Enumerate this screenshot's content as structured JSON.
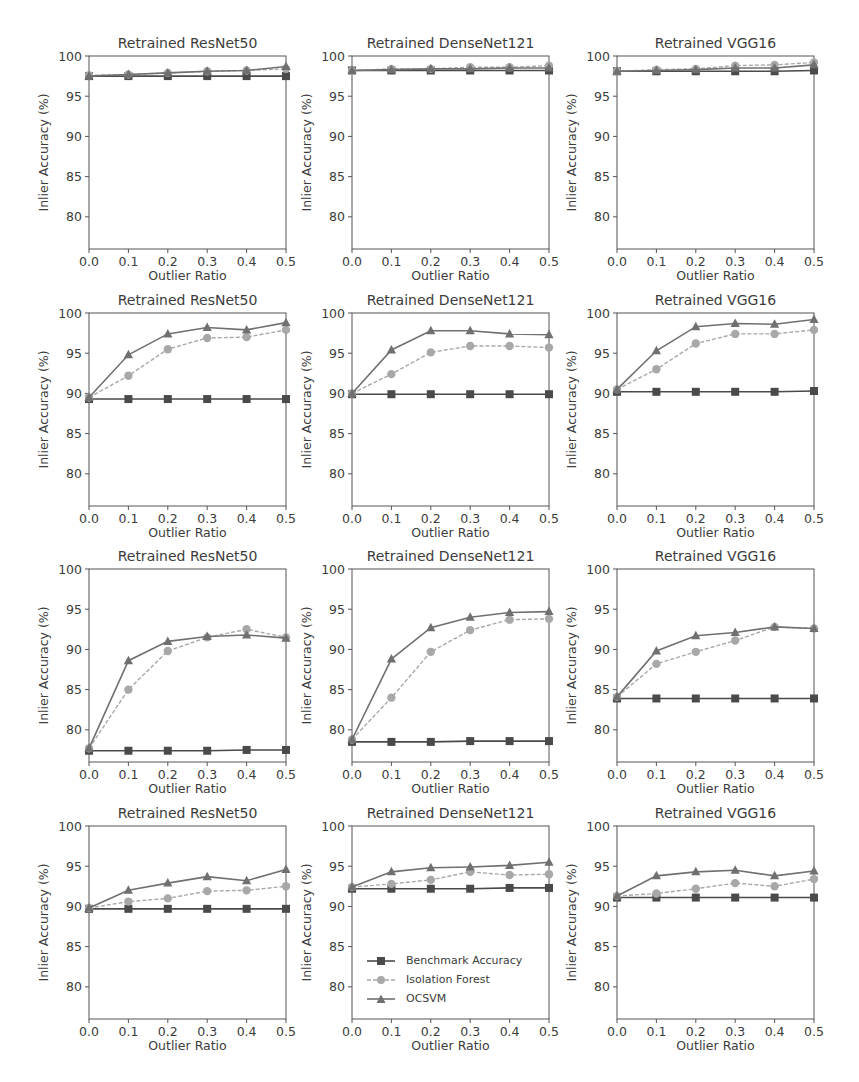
{
  "figure": {
    "legend": [
      {
        "label": "Benchmark Accuracy",
        "marker": "square",
        "color": "#4a4a4a",
        "line": "solid"
      },
      {
        "label": "Isolation Forest",
        "marker": "circle",
        "color": "#a8a8a8",
        "line": "dashed"
      },
      {
        "label": "OCSVM",
        "marker": "triangle",
        "color": "#707070",
        "line": "solid"
      }
    ]
  },
  "chart_data": [
    {
      "type": "line",
      "row": 0,
      "col": 0,
      "title": "Retrained ResNet50",
      "xlabel": "Outlier Ratio",
      "ylabel": "Inlier Accuracy (%)",
      "x": [
        0.0,
        0.1,
        0.2,
        0.3,
        0.4,
        0.5
      ],
      "xticks": [
        "0.0",
        "0.1",
        "0.2",
        "0.3",
        "0.4",
        "0.5"
      ],
      "yticks": [
        80,
        85,
        90,
        95,
        100
      ],
      "xlim": [
        0.0,
        0.5
      ],
      "ylim": [
        76,
        100
      ],
      "series": [
        {
          "name": "Benchmark Accuracy",
          "values": [
            97.5,
            97.5,
            97.5,
            97.5,
            97.5,
            97.5
          ]
        },
        {
          "name": "Isolation Forest",
          "values": [
            97.6,
            97.7,
            97.9,
            98.1,
            98.2,
            98.4
          ]
        },
        {
          "name": "OCSVM",
          "values": [
            97.5,
            97.7,
            97.9,
            98.1,
            98.2,
            98.7
          ]
        }
      ]
    },
    {
      "type": "line",
      "row": 0,
      "col": 1,
      "title": "Retrained DenseNet121",
      "xlabel": "Outlier Ratio",
      "ylabel": "Inlier Accuracy (%)",
      "x": [
        0.0,
        0.1,
        0.2,
        0.3,
        0.4,
        0.5
      ],
      "xticks": [
        "0.0",
        "0.1",
        "0.2",
        "0.3",
        "0.4",
        "0.5"
      ],
      "yticks": [
        80,
        85,
        90,
        95,
        100
      ],
      "xlim": [
        0.0,
        0.5
      ],
      "ylim": [
        76,
        100
      ],
      "series": [
        {
          "name": "Benchmark Accuracy",
          "values": [
            98.2,
            98.2,
            98.2,
            98.2,
            98.2,
            98.2
          ]
        },
        {
          "name": "Isolation Forest",
          "values": [
            98.2,
            98.4,
            98.4,
            98.6,
            98.6,
            98.8
          ]
        },
        {
          "name": "OCSVM",
          "values": [
            98.2,
            98.3,
            98.4,
            98.4,
            98.5,
            98.5
          ]
        }
      ]
    },
    {
      "type": "line",
      "row": 0,
      "col": 2,
      "title": "Retrained VGG16",
      "xlabel": "Outlier Ratio",
      "ylabel": "Inlier Accuracy (%)",
      "x": [
        0.0,
        0.1,
        0.2,
        0.3,
        0.4,
        0.5
      ],
      "xticks": [
        "0.0",
        "0.1",
        "0.2",
        "0.3",
        "0.4",
        "0.5"
      ],
      "yticks": [
        80,
        85,
        90,
        95,
        100
      ],
      "xlim": [
        0.0,
        0.5
      ],
      "ylim": [
        76,
        100
      ],
      "series": [
        {
          "name": "Benchmark Accuracy",
          "values": [
            98.1,
            98.1,
            98.1,
            98.1,
            98.1,
            98.2
          ]
        },
        {
          "name": "Isolation Forest",
          "values": [
            98.1,
            98.3,
            98.4,
            98.8,
            98.9,
            99.2
          ]
        },
        {
          "name": "OCSVM",
          "values": [
            98.1,
            98.2,
            98.3,
            98.5,
            98.5,
            98.9
          ]
        }
      ]
    },
    {
      "type": "line",
      "row": 1,
      "col": 0,
      "title": "Retrained ResNet50",
      "xlabel": "Outlier Ratio",
      "ylabel": "Inlier Accuracy (%)",
      "x": [
        0.0,
        0.1,
        0.2,
        0.3,
        0.4,
        0.5
      ],
      "xticks": [
        "0.0",
        "0.1",
        "0.2",
        "0.3",
        "0.4",
        "0.5"
      ],
      "yticks": [
        80,
        85,
        90,
        95,
        100
      ],
      "xlim": [
        0.0,
        0.5
      ],
      "ylim": [
        76,
        100
      ],
      "series": [
        {
          "name": "Benchmark Accuracy",
          "values": [
            89.3,
            89.3,
            89.3,
            89.3,
            89.3,
            89.3
          ]
        },
        {
          "name": "Isolation Forest",
          "values": [
            89.5,
            92.2,
            95.5,
            96.9,
            97.0,
            97.9
          ]
        },
        {
          "name": "OCSVM",
          "values": [
            89.5,
            94.8,
            97.4,
            98.2,
            97.9,
            98.8
          ]
        }
      ]
    },
    {
      "type": "line",
      "row": 1,
      "col": 1,
      "title": "Retrained DenseNet121",
      "xlabel": "Outlier Ratio",
      "ylabel": "Inlier Accuracy (%)",
      "x": [
        0.0,
        0.1,
        0.2,
        0.3,
        0.4,
        0.5
      ],
      "xticks": [
        "0.0",
        "0.1",
        "0.2",
        "0.3",
        "0.4",
        "0.5"
      ],
      "yticks": [
        80,
        85,
        90,
        95,
        100
      ],
      "xlim": [
        0.0,
        0.5
      ],
      "ylim": [
        76,
        100
      ],
      "series": [
        {
          "name": "Benchmark Accuracy",
          "values": [
            89.9,
            89.9,
            89.9,
            89.9,
            89.9,
            89.9
          ]
        },
        {
          "name": "Isolation Forest",
          "values": [
            90.0,
            92.4,
            95.1,
            95.9,
            95.9,
            95.7
          ]
        },
        {
          "name": "OCSVM",
          "values": [
            90.0,
            95.4,
            97.8,
            97.8,
            97.4,
            97.3
          ]
        }
      ]
    },
    {
      "type": "line",
      "row": 1,
      "col": 2,
      "title": "Retrained VGG16",
      "xlabel": "Outlier Ratio",
      "ylabel": "Inlier Accuracy (%)",
      "x": [
        0.0,
        0.1,
        0.2,
        0.3,
        0.4,
        0.5
      ],
      "xticks": [
        "0.0",
        "0.1",
        "0.2",
        "0.3",
        "0.4",
        "0.5"
      ],
      "yticks": [
        80,
        85,
        90,
        95,
        100
      ],
      "xlim": [
        0.0,
        0.5
      ],
      "ylim": [
        76,
        100
      ],
      "series": [
        {
          "name": "Benchmark Accuracy",
          "values": [
            90.2,
            90.2,
            90.2,
            90.2,
            90.2,
            90.3
          ]
        },
        {
          "name": "Isolation Forest",
          "values": [
            90.5,
            93.0,
            96.2,
            97.4,
            97.4,
            97.9
          ]
        },
        {
          "name": "OCSVM",
          "values": [
            90.5,
            95.3,
            98.3,
            98.7,
            98.6,
            99.2
          ]
        }
      ]
    },
    {
      "type": "line",
      "row": 2,
      "col": 0,
      "title": "Retrained ResNet50",
      "xlabel": "Outlier Ratio",
      "ylabel": "Inlier Accuracy (%)",
      "x": [
        0.0,
        0.1,
        0.2,
        0.3,
        0.4,
        0.5
      ],
      "xticks": [
        "0.0",
        "0.1",
        "0.2",
        "0.3",
        "0.4",
        "0.5"
      ],
      "yticks": [
        80,
        85,
        90,
        95,
        100
      ],
      "xlim": [
        0.0,
        0.5
      ],
      "ylim": [
        76,
        100
      ],
      "series": [
        {
          "name": "Benchmark Accuracy",
          "values": [
            77.4,
            77.4,
            77.4,
            77.4,
            77.5,
            77.5
          ]
        },
        {
          "name": "Isolation Forest",
          "values": [
            77.7,
            85.0,
            89.8,
            91.5,
            92.5,
            91.5
          ]
        },
        {
          "name": "OCSVM",
          "values": [
            77.7,
            88.6,
            91.0,
            91.6,
            91.8,
            91.4
          ]
        }
      ]
    },
    {
      "type": "line",
      "row": 2,
      "col": 1,
      "title": "Retrained DenseNet121",
      "xlabel": "Outlier Ratio",
      "ylabel": "Inlier Accuracy (%)",
      "x": [
        0.0,
        0.1,
        0.2,
        0.3,
        0.4,
        0.5
      ],
      "xticks": [
        "0.0",
        "0.1",
        "0.2",
        "0.3",
        "0.4",
        "0.5"
      ],
      "yticks": [
        80,
        85,
        90,
        95,
        100
      ],
      "xlim": [
        0.0,
        0.5
      ],
      "ylim": [
        76,
        100
      ],
      "series": [
        {
          "name": "Benchmark Accuracy",
          "values": [
            78.5,
            78.5,
            78.5,
            78.6,
            78.6,
            78.6
          ]
        },
        {
          "name": "Isolation Forest",
          "values": [
            78.8,
            84.0,
            89.7,
            92.4,
            93.7,
            93.8
          ]
        },
        {
          "name": "OCSVM",
          "values": [
            78.8,
            88.8,
            92.7,
            94.0,
            94.6,
            94.7
          ]
        }
      ]
    },
    {
      "type": "line",
      "row": 2,
      "col": 2,
      "title": "Retrained VGG16",
      "xlabel": "Outlier Ratio",
      "ylabel": "Inlier Accuracy (%)",
      "x": [
        0.0,
        0.1,
        0.2,
        0.3,
        0.4,
        0.5
      ],
      "xticks": [
        "0.0",
        "0.1",
        "0.2",
        "0.3",
        "0.4",
        "0.5"
      ],
      "yticks": [
        80,
        85,
        90,
        95,
        100
      ],
      "xlim": [
        0.0,
        0.5
      ],
      "ylim": [
        76,
        100
      ],
      "series": [
        {
          "name": "Benchmark Accuracy",
          "values": [
            83.9,
            83.9,
            83.9,
            83.9,
            83.9,
            83.9
          ]
        },
        {
          "name": "Isolation Forest",
          "values": [
            84.1,
            88.2,
            89.7,
            91.1,
            92.8,
            92.6
          ]
        },
        {
          "name": "OCSVM",
          "values": [
            84.1,
            89.8,
            91.7,
            92.1,
            92.8,
            92.6
          ]
        }
      ]
    },
    {
      "type": "line",
      "row": 3,
      "col": 0,
      "title": "Retrained ResNet50",
      "xlabel": "Outlier Ratio",
      "ylabel": "Inlier Accuracy (%)",
      "x": [
        0.0,
        0.1,
        0.2,
        0.3,
        0.4,
        0.5
      ],
      "xticks": [
        "0.0",
        "0.1",
        "0.2",
        "0.3",
        "0.4",
        "0.5"
      ],
      "yticks": [
        80,
        85,
        90,
        95,
        100
      ],
      "xlim": [
        0.0,
        0.5
      ],
      "ylim": [
        76,
        100
      ],
      "series": [
        {
          "name": "Benchmark Accuracy",
          "values": [
            89.7,
            89.7,
            89.7,
            89.7,
            89.7,
            89.7
          ]
        },
        {
          "name": "Isolation Forest",
          "values": [
            89.8,
            90.6,
            91.0,
            91.9,
            92.0,
            92.5
          ]
        },
        {
          "name": "OCSVM",
          "values": [
            89.8,
            92.0,
            92.9,
            93.7,
            93.2,
            94.6
          ]
        }
      ]
    },
    {
      "type": "line",
      "row": 3,
      "col": 1,
      "title": "Retrained DenseNet121",
      "xlabel": "Outlier Ratio",
      "ylabel": "Inlier Accuracy (%)",
      "x": [
        0.0,
        0.1,
        0.2,
        0.3,
        0.4,
        0.5
      ],
      "xticks": [
        "0.0",
        "0.1",
        "0.2",
        "0.3",
        "0.4",
        "0.5"
      ],
      "yticks": [
        80,
        85,
        90,
        95,
        100
      ],
      "xlim": [
        0.0,
        0.5
      ],
      "ylim": [
        76,
        100
      ],
      "series": [
        {
          "name": "Benchmark Accuracy",
          "values": [
            92.2,
            92.2,
            92.2,
            92.2,
            92.3,
            92.3
          ]
        },
        {
          "name": "Isolation Forest",
          "values": [
            92.4,
            92.8,
            93.3,
            94.3,
            93.9,
            94.0
          ]
        },
        {
          "name": "OCSVM",
          "values": [
            92.4,
            94.3,
            94.8,
            94.9,
            95.1,
            95.5
          ]
        }
      ]
    },
    {
      "type": "line",
      "row": 3,
      "col": 2,
      "title": "Retrained VGG16",
      "xlabel": "Outlier Ratio",
      "ylabel": "Inlier Accuracy (%)",
      "x": [
        0.0,
        0.1,
        0.2,
        0.3,
        0.4,
        0.5
      ],
      "xticks": [
        "0.0",
        "0.1",
        "0.2",
        "0.3",
        "0.4",
        "0.5"
      ],
      "yticks": [
        80,
        85,
        90,
        95,
        100
      ],
      "xlim": [
        0.0,
        0.5
      ],
      "ylim": [
        76,
        100
      ],
      "series": [
        {
          "name": "Benchmark Accuracy",
          "values": [
            91.1,
            91.1,
            91.1,
            91.1,
            91.1,
            91.1
          ]
        },
        {
          "name": "Isolation Forest",
          "values": [
            91.3,
            91.6,
            92.2,
            92.9,
            92.5,
            93.4
          ]
        },
        {
          "name": "OCSVM",
          "values": [
            91.3,
            93.8,
            94.3,
            94.5,
            93.8,
            94.4
          ]
        }
      ]
    }
  ]
}
